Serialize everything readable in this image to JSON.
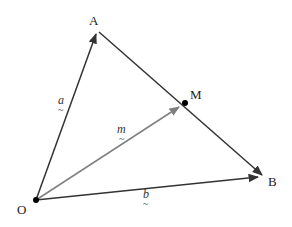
{
  "diagram": {
    "points": {
      "O": {
        "label": "O",
        "x": 36,
        "y": 200
      },
      "A": {
        "label": "A",
        "x": 97,
        "y": 30
      },
      "M": {
        "label": "M",
        "x": 185,
        "y": 103
      },
      "B": {
        "label": "B",
        "x": 264,
        "y": 177
      }
    },
    "vectors": {
      "a": {
        "label": "a",
        "underline": "~",
        "from": "O",
        "to": "A",
        "color": "#333333"
      },
      "m": {
        "label": "m",
        "underline": "~",
        "from": "O",
        "to": "M",
        "color": "#808080"
      },
      "b": {
        "label": "b",
        "underline": "~",
        "from": "O",
        "to": "B",
        "color": "#333333"
      }
    },
    "segment_AB": {
      "from": "A",
      "to": "B",
      "color": "#333333",
      "arrow_at": "B"
    }
  }
}
